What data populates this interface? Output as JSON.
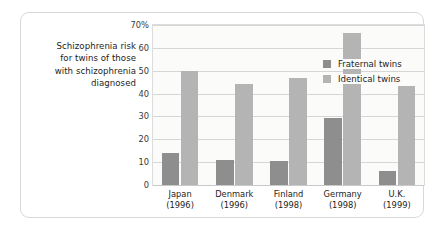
{
  "caption": {
    "lines": [
      "Schizophrenia risk",
      "for twins of those",
      "with schizophrenia",
      "diagnosed"
    ]
  },
  "legend": {
    "position": "top-left-inside",
    "items": [
      {
        "label": "Fraternal twins",
        "color": "#8e8e8e"
      },
      {
        "label": "Identical twins",
        "color": "#b4b4b4"
      }
    ]
  },
  "colors": {
    "fraternal": "#8e8e8e",
    "identical": "#b4b4b4",
    "gridline": "#d6d6d6",
    "plot_background": "#fbfbfa",
    "card_border": "#d8d8d8",
    "text": "#1d1d1b"
  },
  "chart_data": {
    "type": "bar",
    "title": "",
    "xlabel": "",
    "ylabel": "",
    "ylim": [
      0,
      70
    ],
    "yticks": [
      0,
      10,
      20,
      30,
      40,
      50,
      60,
      70
    ],
    "ytick_labels": [
      "0",
      "10",
      "20",
      "30",
      "40",
      "50",
      "60",
      "70%"
    ],
    "grid": true,
    "legend_position": "top-left",
    "categories": [
      "Japan\n(1996)",
      "Denmark\n(1996)",
      "Finland\n(1998)",
      "Germany\n(1998)",
      "U.K.\n(1999)"
    ],
    "category_labels": [
      {
        "country": "Japan",
        "year": "(1996)"
      },
      {
        "country": "Denmark",
        "year": "(1996)"
      },
      {
        "country": "Finland",
        "year": "(1998)"
      },
      {
        "country": "Germany",
        "year": "(1998)"
      },
      {
        "country": "U.K.",
        "year": "(1999)"
      }
    ],
    "series": [
      {
        "name": "Fraternal twins",
        "color": "#8e8e8e",
        "values": [
          14,
          11,
          10.5,
          29.5,
          6
        ]
      },
      {
        "name": "Identical twins",
        "color": "#b4b4b4",
        "values": [
          50,
          44,
          47,
          66.5,
          43.5
        ]
      }
    ]
  }
}
